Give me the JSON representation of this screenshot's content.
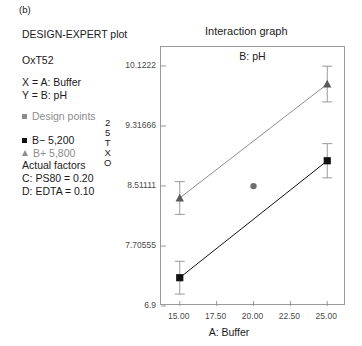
{
  "figure": {
    "label": "(b)"
  },
  "panel": {
    "software_title": "DESIGN-EXPERT plot",
    "response_name": "OxT52",
    "x_mapping": "X = A: Buffer",
    "y_mapping": "Y = B: pH",
    "design_points_label": "Design points",
    "series_low_label": "B− 5,200",
    "series_high_label": "B+ 5,800",
    "actual_factors_heading": "Actual factors",
    "actual_factor_c": "C: PS80 = 0.20",
    "actual_factor_d": "D: EDTA = 0.10",
    "vertical_code": [
      "2",
      "5",
      "T",
      "X",
      "O"
    ]
  },
  "colors": {
    "series_low": "#111111",
    "series_high": "#8d8d8d",
    "design_point": "#6f6f6f",
    "axis": "#9a9a9a",
    "text": "#1a1a1a",
    "muted_text": "#8d8d8d"
  },
  "chart_data": {
    "type": "line",
    "title": "Interaction graph",
    "inner_label": "B: pH",
    "xlabel": "A: Buffer",
    "ylabel": "",
    "xlim": [
      14.0,
      26.0
    ],
    "ylim": [
      6.9,
      10.1222
    ],
    "grid": false,
    "legend_position": "left-panel",
    "xticks": [
      15.0,
      17.5,
      20.0,
      22.5,
      25.0
    ],
    "xticklabels": [
      "15.00",
      "17.50",
      "20.00",
      "22.50",
      "25.00"
    ],
    "yticks": [
      6.9,
      7.70555,
      8.51111,
      9.31666,
      10.1222
    ],
    "yticklabels": [
      "6.9",
      "7.70555",
      "8.51111",
      "9.31666",
      "10.1222"
    ],
    "x": [
      15.0,
      25.0
    ],
    "series": [
      {
        "name": "B− 5,200",
        "marker": "square",
        "color": "#111111",
        "values": [
          7.28,
          8.85
        ],
        "errors": [
          0.22,
          0.23
        ]
      },
      {
        "name": "B+ 5,800",
        "marker": "triangle",
        "color": "#8d8d8d",
        "values": [
          8.35,
          9.88
        ],
        "errors": [
          0.22,
          0.24
        ]
      }
    ],
    "design_points": [
      {
        "x": 20.0,
        "y": 8.51,
        "marker": "circle",
        "color": "#6f6f6f"
      }
    ]
  }
}
